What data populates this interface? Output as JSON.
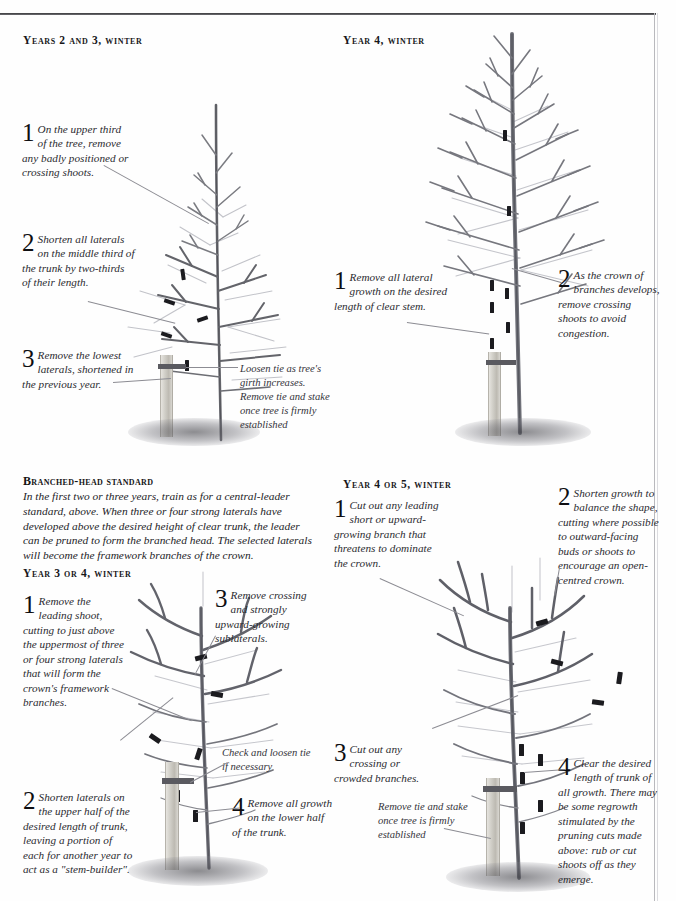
{
  "page": {
    "domain_note": "Book page: tree pruning illustrations, four panels"
  },
  "panels": [
    {
      "id": "years-2-3-winter",
      "heading": "Years 2 and 3, winter",
      "heading_first": "Y",
      "annotations": [
        {
          "num": "1",
          "text": "On the upper third of the tree, remove any badly positioned or crossing shoots."
        },
        {
          "num": "2",
          "text": "Shorten all laterals on the middle third of the trunk by two-thirds of their length."
        },
        {
          "num": "3",
          "text": "Remove the lowest laterals, shortened in the previous year."
        }
      ],
      "notes": [
        {
          "text": "Loosen tie as tree's girth increases. Remove tie and stake once tree is firmly established"
        }
      ]
    },
    {
      "id": "year-4-winter",
      "heading": "Year 4, winter",
      "heading_first": "Y",
      "annotations": [
        {
          "num": "1",
          "text": "Remove all lateral growth on the desired length of clear stem."
        },
        {
          "num": "2",
          "text": "As the crown of branches develops, remove crossing shoots to avoid congestion."
        }
      ],
      "notes": []
    },
    {
      "id": "branched-head-standard",
      "heading": "Branched-head standard",
      "heading_first": "B",
      "body": "In the first two or three years, train as for a central-leader standard, above. When three or four strong laterals have developed above the desired height of clear trunk, the leader can be pruned to form the branched head. The selected laterals will become the framework branches of the crown.",
      "annotations": [],
      "notes": []
    },
    {
      "id": "year-3-or-4-winter",
      "heading": "Year 3 or 4, winter",
      "heading_first": "Y",
      "annotations": [
        {
          "num": "1",
          "text": "Remove the leading shoot, cutting to just above the uppermost of three or four strong laterals that will form the crown's framework branches."
        },
        {
          "num": "2",
          "text": "Shorten laterals on the upper half of the desired length of trunk, leaving a portion of each for another year to act as a \"stem-builder\"."
        },
        {
          "num": "3",
          "text": "Remove crossing and strongly upward-growing sublaterals."
        },
        {
          "num": "4",
          "text": "Remove all growth on the lower half of the trunk."
        }
      ],
      "notes": [
        {
          "text": "Check and loosen tie if necessary"
        }
      ]
    },
    {
      "id": "year-4-or-5-winter",
      "heading": "Year 4 or 5, winter",
      "heading_first": "Y",
      "annotations": [
        {
          "num": "1",
          "text": "Cut out any leading short or upward-growing branch that threatens to dominate the crown."
        },
        {
          "num": "2",
          "text": "Shorten growth to balance the shape, cutting where possible to outward-facing buds or shoots to encourage an open-centred crown."
        },
        {
          "num": "3",
          "text": "Cut out any crossing or crowded branches."
        },
        {
          "num": "4",
          "text": "Clear the desired length of trunk of all growth. There may be some regrowth stimulated by the pruning cuts made above: rub or cut shoots off as they emerge."
        }
      ],
      "notes": [
        {
          "text": "Remove tie and stake once tree is firmly established"
        }
      ]
    }
  ],
  "colors": {
    "ink": "#2b2b30",
    "branch_dark": "#5f6066",
    "branch_light": "#b9bac0",
    "cut_mark": "#1b1b1f",
    "stake": "#cfcdc6",
    "tie": "#45454a",
    "rule": "#3a3a3c"
  }
}
